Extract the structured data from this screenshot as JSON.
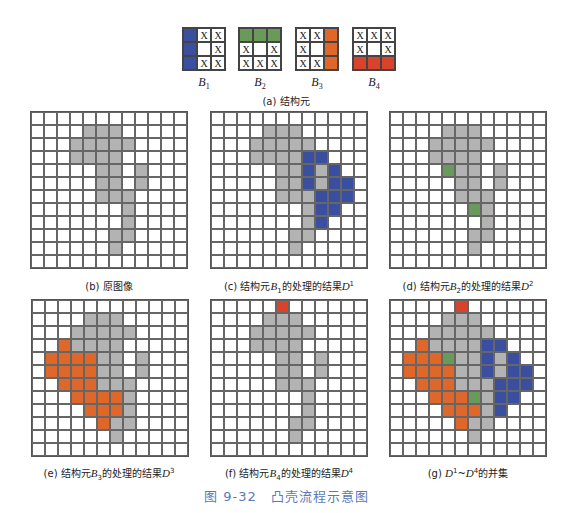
{
  "colors": {
    "background": "#ffffff",
    "object": "#b3b3b3",
    "b1": "#3a4fa0",
    "b2": "#6a9a5a",
    "b3": "#e0672a",
    "b4": "#d9432b",
    "grid_line": "#666666",
    "figure_title": "#5a7ab5"
  },
  "legend": {
    "codes": "0=white, 1=gray object, 2=blue B1, 3=green B2, 4=orange B3, 5=red B4, X=don't-care"
  },
  "structuring_elements": {
    "caption": "(a) 结构元",
    "items": [
      {
        "name": "B",
        "sub": "1",
        "cells": [
          [
            "F",
            "X",
            "X"
          ],
          [
            "F",
            "",
            "X"
          ],
          [
            "F",
            "X",
            "X"
          ]
        ],
        "fill": "b1"
      },
      {
        "name": "B",
        "sub": "2",
        "cells": [
          [
            "F",
            "F",
            "F"
          ],
          [
            "X",
            "",
            "X"
          ],
          [
            "X",
            "X",
            "X"
          ]
        ],
        "fill": "b2"
      },
      {
        "name": "B",
        "sub": "3",
        "cells": [
          [
            "X",
            "X",
            "F"
          ],
          [
            "X",
            "",
            "F"
          ],
          [
            "X",
            "X",
            "F"
          ]
        ],
        "fill": "b3"
      },
      {
        "name": "B",
        "sub": "4",
        "cells": [
          [
            "X",
            "X",
            "X"
          ],
          [
            "X",
            "",
            "X"
          ],
          [
            "F",
            "F",
            "F"
          ]
        ],
        "fill": "b4"
      }
    ]
  },
  "panels": [
    {
      "id": "b",
      "caption_prefix": "(b) 原图像",
      "caption_var": "",
      "caption_sup": "",
      "caption_suffix": "",
      "cells": [
        "000000000000",
        "000011100000",
        "000111110000",
        "000111100000",
        "000001101000",
        "000001101000",
        "000001110000",
        "000000010000",
        "000000010000",
        "000000110000",
        "000000100000",
        "000000000000"
      ]
    },
    {
      "id": "c",
      "caption_prefix": "(c) 结构元",
      "caption_var": "B",
      "caption_sub": "1",
      "caption_mid": "的处理的结果",
      "caption_res": "D",
      "caption_sup": "1",
      "cells": [
        "000000000000",
        "000011100000",
        "000111110000",
        "000111122000",
        "000001121200",
        "000001121220",
        "000001112220",
        "000000012200",
        "000000012000",
        "000000110000",
        "000000100000",
        "000000000000"
      ]
    },
    {
      "id": "d",
      "caption_prefix": "(d) 结构元",
      "caption_var": "B",
      "caption_sub": "2",
      "caption_mid": "的处理的结果",
      "caption_res": "D",
      "caption_sup": "2",
      "cells": [
        "000000000000",
        "000011100000",
        "000111110000",
        "000111100000",
        "000031101000",
        "000001101000",
        "000001110000",
        "000000310000",
        "000000010000",
        "000000110000",
        "000000100000",
        "000000000000"
      ]
    },
    {
      "id": "e",
      "caption_prefix": "(e) 结构元",
      "caption_var": "B",
      "caption_sub": "3",
      "caption_mid": "的处理的结果",
      "caption_res": "D",
      "caption_sup": "3",
      "cells": [
        "000000000000",
        "000011100000",
        "000111110000",
        "004111100000",
        "044441101000",
        "044441101000",
        "004441110000",
        "000444410000",
        "000044410000",
        "000004110000",
        "000000100000",
        "000000000000"
      ]
    },
    {
      "id": "f",
      "caption_prefix": "(f) 结构元",
      "caption_var": "B",
      "caption_sub": "4",
      "caption_mid": "的处理的结果",
      "caption_res": "D",
      "caption_sup": "4",
      "cells": [
        "000005000000",
        "000011100000",
        "000111110000",
        "000111100000",
        "000001101000",
        "000001101000",
        "000001110000",
        "000000010000",
        "000000010000",
        "000000110000",
        "000000100000",
        "000000000000"
      ]
    },
    {
      "id": "g",
      "caption_prefix": "(g) ",
      "caption_var": "D",
      "caption_sup": "1",
      "caption_mid": "~",
      "caption_res": "D",
      "caption_sup2": "4",
      "caption_suffix": "的并集",
      "cells": [
        "000005000000",
        "000011100000",
        "000111110000",
        "004111122000",
        "044431121200",
        "044441121220",
        "004441112220",
        "000444312200",
        "000044412000",
        "000004110000",
        "000000100000",
        "000000000000"
      ]
    }
  ],
  "figure_title": "图 9-32　凸壳流程示意图"
}
